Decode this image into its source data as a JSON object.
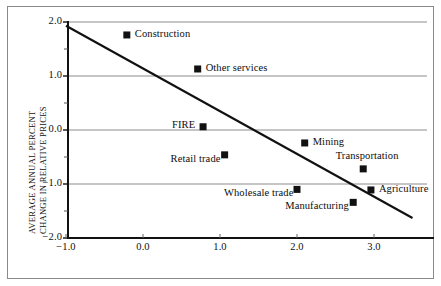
{
  "chart_data": {
    "type": "scatter",
    "title": "",
    "xlabel": "",
    "ylabel": "AVERAGE ANNUAL PERCENT CHANGE IN RELATIVE PRICES",
    "ylabel_line1": "AVERAGE ANNUAL PERCENT",
    "ylabel_line2": "CHANGE IN RELATIVE PRICES",
    "xlim": [
      -1.0,
      3.5
    ],
    "ylim": [
      -2.0,
      2.0
    ],
    "xticks": [
      "-1.0",
      "0.0",
      "1.0",
      "2.0",
      "3.0"
    ],
    "xtick_values": [
      -1.0,
      0.0,
      1.0,
      2.0,
      3.0
    ],
    "yticks": [
      "2.0",
      "1.0",
      "0.0",
      "-1.0",
      "-2.0"
    ],
    "ytick_values": [
      2.0,
      1.0,
      0.0,
      -1.0,
      -2.0
    ],
    "yminor_values": [
      1.5,
      0.5,
      -0.5,
      -1.5
    ],
    "grid": "horizontal-major",
    "legend": "none",
    "marker": "filled-square",
    "marker_color": "#111111",
    "points": [
      {
        "label": "Construction",
        "x": -0.21,
        "y": 1.76,
        "label_pos": "right"
      },
      {
        "label": "Other services",
        "x": 0.71,
        "y": 1.13,
        "label_pos": "right"
      },
      {
        "label": "FIRE",
        "x": 0.78,
        "y": 0.06,
        "label_pos": "left"
      },
      {
        "label": "Retail trade",
        "x": 1.06,
        "y": -0.46,
        "label_pos": "below-left"
      },
      {
        "label": "Mining",
        "x": 2.1,
        "y": -0.24,
        "label_pos": "right"
      },
      {
        "label": "Transportation",
        "x": 2.86,
        "y": -0.72,
        "label_pos": "above"
      },
      {
        "label": "Wholesale trade",
        "x": 2.0,
        "y": -1.1,
        "label_pos": "below-left"
      },
      {
        "label": "Agriculture",
        "x": 2.96,
        "y": -1.11,
        "label_pos": "right"
      },
      {
        "label": "Manufacturing",
        "x": 2.73,
        "y": -1.34,
        "label_pos": "below-left"
      }
    ],
    "trendline": {
      "x1": -1.0,
      "y1": 1.93,
      "x2": 3.5,
      "y2": -1.63,
      "color": "#111111"
    }
  }
}
